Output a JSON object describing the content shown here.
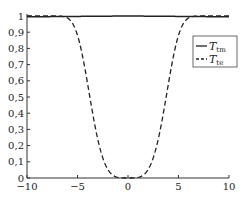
{
  "chart_data": {
    "type": "line",
    "title": "",
    "xlabel": "",
    "ylabel": "",
    "xlim": [
      -10,
      10
    ],
    "ylim": [
      0,
      1
    ],
    "grid": false,
    "legend_position": "upper right (inside)",
    "x_ticks": [
      "−10",
      "−5",
      "0",
      "5",
      "10"
    ],
    "y_ticks": [
      "0",
      "0,1",
      "0,2",
      "0,3",
      "0,4",
      "0,5",
      "0,6",
      "0,7",
      "0,8",
      "0,9",
      "1"
    ],
    "series": [
      {
        "name": "T_tm",
        "style": "solid",
        "x": [
          -10,
          -8,
          -6,
          -4,
          -2,
          0,
          2,
          4,
          6,
          8,
          10
        ],
        "values": [
          0.995,
          0.996,
          0.997,
          0.998,
          0.999,
          1.0,
          0.999,
          0.998,
          0.997,
          0.996,
          0.995
        ]
      },
      {
        "name": "T_te",
        "style": "dashed",
        "x": [
          -10,
          -9,
          -8,
          -7,
          -6,
          -5,
          -4,
          -3,
          -2,
          -1,
          0,
          1,
          2,
          3,
          4,
          5,
          6,
          7,
          8,
          9,
          10
        ],
        "values": [
          1.0,
          0.99,
          0.97,
          0.92,
          0.8,
          0.55,
          0.28,
          0.1,
          0.03,
          0.005,
          0.0,
          0.005,
          0.03,
          0.1,
          0.28,
          0.55,
          0.8,
          0.92,
          0.97,
          0.99,
          1.0
        ]
      }
    ]
  },
  "legend": {
    "items": [
      {
        "symbol": "T",
        "sub": "tm",
        "style": "solid"
      },
      {
        "symbol": "T",
        "sub": "te",
        "style": "dashed"
      }
    ]
  }
}
